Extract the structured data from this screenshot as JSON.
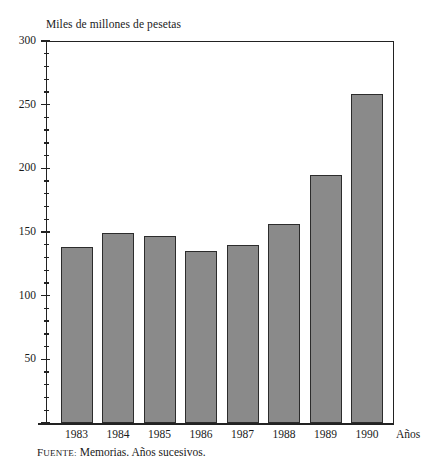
{
  "chart_data": {
    "type": "bar",
    "title": "Miles de millones de pesetas",
    "xlabel": "Años",
    "ylabel": "Miles de millones de pesetas",
    "categories": [
      "1983",
      "1984",
      "1985",
      "1986",
      "1987",
      "1988",
      "1989",
      "1990"
    ],
    "values": [
      138,
      149,
      147,
      135,
      140,
      156,
      195,
      258
    ],
    "ylim": [
      0,
      300
    ],
    "yticks": [
      0,
      50,
      100,
      150,
      200,
      250,
      300
    ],
    "ytick_labels": [
      "",
      "50",
      "100",
      "150",
      "200",
      "250",
      "300"
    ],
    "minor_tick_step": 10,
    "grid": false,
    "legend": false,
    "bar_color": "#8a8a8a",
    "bar_edge_color": "#2c2c2c",
    "axis_color": "#222222",
    "source_prefix_first": "F",
    "source_prefix_rest": "UENTE:",
    "source_text": "Memorias. Años sucesivos."
  }
}
